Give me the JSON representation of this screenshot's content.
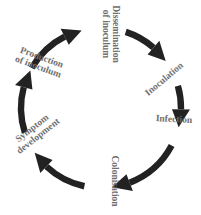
{
  "diagram": {
    "type": "cycle",
    "direction": "clockwise",
    "arrow_color": "#222222",
    "label_color": "#6e6e6e",
    "stages": [
      {
        "id": "dissemination",
        "lines": [
          "Dissemination",
          "of inoculum"
        ]
      },
      {
        "id": "inoculation",
        "lines": [
          "Inoculation"
        ]
      },
      {
        "id": "infection",
        "lines": [
          "Infection"
        ]
      },
      {
        "id": "colonisation",
        "lines": [
          "Colonisation"
        ]
      },
      {
        "id": "symptom",
        "lines": [
          "Symptom",
          "development"
        ]
      },
      {
        "id": "production",
        "lines": [
          "Production",
          "of inoculum"
        ]
      }
    ],
    "arrows": [
      {
        "from": "production",
        "to": "dissemination"
      },
      {
        "from": "dissemination",
        "to": "inoculation"
      },
      {
        "from": "inoculation",
        "to": "infection"
      },
      {
        "from": "infection",
        "to": "colonisation"
      },
      {
        "from": "colonisation",
        "to": "symptom"
      },
      {
        "from": "symptom",
        "to": "production"
      }
    ]
  }
}
